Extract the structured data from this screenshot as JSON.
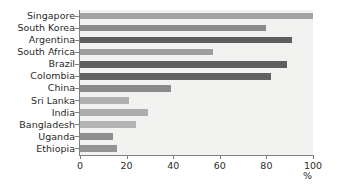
{
  "chart_data": {
    "type": "bar",
    "orientation": "horizontal",
    "title": "",
    "subtitle": "",
    "xlabel": "%",
    "ylabel": "",
    "categories": [
      "Singapore",
      "South Korea",
      "Argentina",
      "South Africa",
      "Brazil",
      "Colombia",
      "China",
      "Sri Lanka",
      "India",
      "Bangladesh",
      "Uganda",
      "Ethiopia"
    ],
    "values": [
      100,
      80,
      91,
      57,
      89,
      82,
      39,
      21,
      29,
      24,
      14,
      16
    ],
    "bar_colors": [
      "#a3a3a3",
      "#8c8c8c",
      "#5e5e5e",
      "#9e9e9e",
      "#5e5e5e",
      "#616161",
      "#8a8a8a",
      "#b0b0b0",
      "#adadad",
      "#b3b3b3",
      "#8f8f8f",
      "#949494"
    ],
    "xlim": [
      0,
      100
    ],
    "xticks": [
      0,
      20,
      40,
      60,
      80,
      100
    ],
    "xtick_labels": [
      "0",
      "20",
      "40",
      "60",
      "80",
      "100"
    ],
    "grid": false,
    "legend": null,
    "plot_background": "#f2f2f0",
    "axis_color": "#808080",
    "text_color": "#2b2b2b"
  }
}
